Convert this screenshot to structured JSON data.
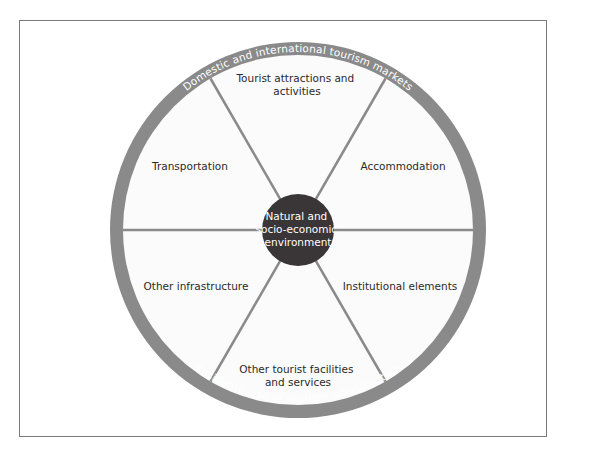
{
  "diagram": {
    "ring": {
      "top_label": "Domestic and international tourism markets",
      "bottom_label": "Residents' use of tourism infrastructure",
      "color": "#8a8a8a"
    },
    "center": {
      "lines": [
        "Natural and",
        "socio-economic",
        "environment"
      ],
      "color": "#3a3536"
    },
    "segments": [
      {
        "position": "top",
        "lines": [
          "Tourist attractions and",
          "activities"
        ]
      },
      {
        "position": "upper-right",
        "lines": [
          "Accommodation"
        ]
      },
      {
        "position": "lower-right",
        "lines": [
          "Institutional elements"
        ]
      },
      {
        "position": "bottom",
        "lines": [
          "Other tourist facilities",
          "and services"
        ]
      },
      {
        "position": "lower-left",
        "lines": [
          "Other infrastructure"
        ]
      },
      {
        "position": "upper-left",
        "lines": [
          "Transportation"
        ]
      }
    ],
    "colors": {
      "fill": "#fbfbfb",
      "divider": "#8a8a8a",
      "frame": "#7a7a7a"
    }
  }
}
